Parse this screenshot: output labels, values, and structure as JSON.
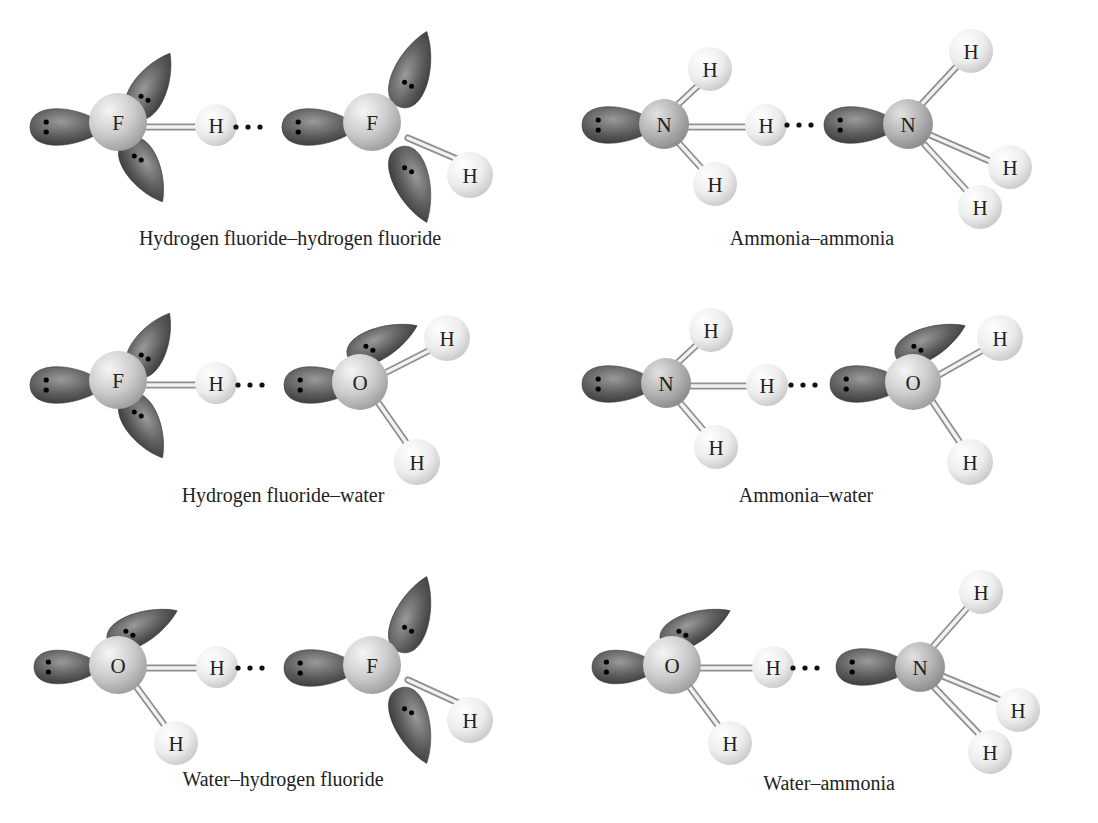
{
  "figure": {
    "colors": {
      "lobe_dark": "#4a4a4a",
      "lobe_light": "#9a9a9a",
      "heavy_atom_light": "#e6e6e6",
      "heavy_atom_dark": "#9c9c9c",
      "hydrogen_light": "#f7f7f7",
      "hydrogen_dark": "#c8c8c8",
      "bond_light": "#f4f4f4",
      "bond_dark": "#9a9a9a",
      "text": "#222222"
    },
    "panels": [
      {
        "id": "hf-hf",
        "caption": "Hydrogen fluoride–hydrogen fluoride",
        "caption_pos": [
          290,
          245
        ],
        "dots": [
          248,
          127
        ],
        "lobes": [
          {
            "x": 66,
            "y": 127,
            "rx": 36,
            "ry": 25,
            "rot": 0,
            "tipx": 105,
            "dots": "v"
          },
          {
            "x": 150,
            "y": 88,
            "rx": 34,
            "ry": 24,
            "rot": -60,
            "dots": "d"
          },
          {
            "x": 143,
            "y": 168,
            "rx": 33,
            "ry": 24,
            "rot": 60,
            "dots": "d"
          },
          {
            "x": 318,
            "y": 127,
            "rx": 36,
            "ry": 25,
            "rot": 0,
            "dots": "v"
          },
          {
            "x": 412,
            "y": 72,
            "rx": 37,
            "ry": 25,
            "rot": -70,
            "dots": "d"
          },
          {
            "x": 412,
            "y": 182,
            "rx": 37,
            "ry": 25,
            "rot": 70,
            "dots": "d"
          }
        ],
        "bonds": [
          {
            "x1": 140,
            "y1": 127,
            "x2": 205,
            "y2": 127
          },
          {
            "x1": 408,
            "y1": 138,
            "x2": 478,
            "y2": 168
          }
        ],
        "atoms": [
          {
            "el": "F",
            "x": 118,
            "y": 122,
            "r": 29,
            "kind": "heavy"
          },
          {
            "el": "H",
            "x": 216,
            "y": 125,
            "r": 21,
            "kind": "h"
          },
          {
            "el": "F",
            "x": 372,
            "y": 122,
            "r": 29,
            "kind": "heavy"
          },
          {
            "el": "H",
            "x": 470,
            "y": 175,
            "r": 23,
            "kind": "h"
          }
        ]
      },
      {
        "id": "nh3-nh3",
        "caption": "Ammonia–ammonia",
        "caption_pos": [
          812,
          245
        ],
        "dots": [
          799,
          125
        ],
        "lobes": [
          {
            "x": 618,
            "y": 125,
            "rx": 36,
            "ry": 25,
            "rot": 0,
            "dots": "v"
          },
          {
            "x": 860,
            "y": 125,
            "rx": 36,
            "ry": 25,
            "rot": 0,
            "dots": "v"
          }
        ],
        "bonds": [
          {
            "x1": 680,
            "y1": 127,
            "x2": 750,
            "y2": 127
          },
          {
            "x1": 672,
            "y1": 110,
            "x2": 702,
            "y2": 82
          },
          {
            "x1": 676,
            "y1": 140,
            "x2": 705,
            "y2": 172
          },
          {
            "x1": 918,
            "y1": 108,
            "x2": 958,
            "y2": 65
          },
          {
            "x1": 930,
            "y1": 135,
            "x2": 992,
            "y2": 162
          },
          {
            "x1": 925,
            "y1": 145,
            "x2": 968,
            "y2": 192
          }
        ],
        "atoms": [
          {
            "el": "N",
            "x": 664,
            "y": 124,
            "r": 25,
            "kind": "heavy2"
          },
          {
            "el": "H",
            "x": 710,
            "y": 69,
            "r": 22,
            "kind": "h"
          },
          {
            "el": "H",
            "x": 715,
            "y": 184,
            "r": 22,
            "kind": "h"
          },
          {
            "el": "H",
            "x": 766,
            "y": 125,
            "r": 21,
            "kind": "h"
          },
          {
            "el": "N",
            "x": 908,
            "y": 124,
            "r": 25,
            "kind": "heavy2"
          },
          {
            "el": "H",
            "x": 971,
            "y": 51,
            "r": 22,
            "kind": "h"
          },
          {
            "el": "H",
            "x": 1010,
            "y": 167,
            "r": 22,
            "kind": "h"
          },
          {
            "el": "H",
            "x": 980,
            "y": 207,
            "r": 22,
            "kind": "h"
          }
        ]
      },
      {
        "id": "hf-h2o",
        "caption": "Hydrogen fluoride–water",
        "caption_pos": [
          283,
          502
        ],
        "dots": [
          250,
          385
        ],
        "lobes": [
          {
            "x": 66,
            "y": 385,
            "rx": 36,
            "ry": 25,
            "rot": 0,
            "dots": "v"
          },
          {
            "x": 150,
            "y": 347,
            "rx": 33,
            "ry": 24,
            "rot": -60,
            "dots": "d"
          },
          {
            "x": 143,
            "y": 424,
            "rx": 33,
            "ry": 24,
            "rot": 60,
            "dots": "d"
          },
          {
            "x": 320,
            "y": 385,
            "rx": 36,
            "ry": 25,
            "rot": 0,
            "dots": "v"
          },
          {
            "x": 380,
            "y": 343,
            "rx": 35,
            "ry": 22,
            "rot": -25,
            "dots": "d"
          }
        ],
        "bonds": [
          {
            "x1": 140,
            "y1": 385,
            "x2": 205,
            "y2": 385
          },
          {
            "x1": 375,
            "y1": 378,
            "x2": 440,
            "y2": 345
          },
          {
            "x1": 375,
            "y1": 398,
            "x2": 410,
            "y2": 448
          }
        ],
        "atoms": [
          {
            "el": "F",
            "x": 118,
            "y": 380,
            "r": 29,
            "kind": "heavy"
          },
          {
            "el": "H",
            "x": 216,
            "y": 383,
            "r": 21,
            "kind": "h"
          },
          {
            "el": "O",
            "x": 360,
            "y": 382,
            "r": 28,
            "kind": "heavy"
          },
          {
            "el": "H",
            "x": 447,
            "y": 338,
            "r": 23,
            "kind": "h"
          },
          {
            "el": "H",
            "x": 417,
            "y": 462,
            "r": 23,
            "kind": "h"
          }
        ]
      },
      {
        "id": "nh3-h2o",
        "caption": "Ammonia–water",
        "caption_pos": [
          806,
          502
        ],
        "dots": [
          803,
          385
        ],
        "lobes": [
          {
            "x": 618,
            "y": 384,
            "rx": 36,
            "ry": 25,
            "rot": 0,
            "dots": "v"
          },
          {
            "x": 866,
            "y": 384,
            "rx": 36,
            "ry": 25,
            "rot": 0,
            "dots": "v"
          },
          {
            "x": 928,
            "y": 343,
            "rx": 35,
            "ry": 22,
            "rot": -25,
            "dots": "d"
          }
        ],
        "bonds": [
          {
            "x1": 680,
            "y1": 386,
            "x2": 750,
            "y2": 386
          },
          {
            "x1": 672,
            "y1": 368,
            "x2": 702,
            "y2": 340
          },
          {
            "x1": 676,
            "y1": 398,
            "x2": 705,
            "y2": 432
          },
          {
            "x1": 930,
            "y1": 380,
            "x2": 990,
            "y2": 346
          },
          {
            "x1": 930,
            "y1": 398,
            "x2": 965,
            "y2": 450
          }
        ],
        "atoms": [
          {
            "el": "N",
            "x": 666,
            "y": 383,
            "r": 25,
            "kind": "heavy2"
          },
          {
            "el": "H",
            "x": 711,
            "y": 330,
            "r": 22,
            "kind": "h"
          },
          {
            "el": "H",
            "x": 716,
            "y": 447,
            "r": 22,
            "kind": "h"
          },
          {
            "el": "H",
            "x": 767,
            "y": 385,
            "r": 21,
            "kind": "h"
          },
          {
            "el": "O",
            "x": 913,
            "y": 382,
            "r": 28,
            "kind": "heavy"
          },
          {
            "el": "H",
            "x": 1000,
            "y": 338,
            "r": 23,
            "kind": "h"
          },
          {
            "el": "H",
            "x": 970,
            "y": 462,
            "r": 23,
            "kind": "h"
          }
        ]
      },
      {
        "id": "h2o-hf",
        "caption": "Water–hydrogen fluoride",
        "caption_pos": [
          283,
          786
        ],
        "dots": [
          250,
          668
        ],
        "lobes": [
          {
            "x": 66,
            "y": 667,
            "rx": 32,
            "ry": 23,
            "rot": 0,
            "dots": "v"
          },
          {
            "x": 140,
            "y": 628,
            "rx": 35,
            "ry": 22,
            "rot": -25,
            "dots": "d"
          },
          {
            "x": 320,
            "y": 668,
            "rx": 36,
            "ry": 25,
            "rot": 0,
            "dots": "v"
          },
          {
            "x": 412,
            "y": 617,
            "rx": 37,
            "ry": 25,
            "rot": -70,
            "dots": "d"
          },
          {
            "x": 412,
            "y": 723,
            "rx": 37,
            "ry": 25,
            "rot": 70,
            "dots": "d"
          }
        ],
        "bonds": [
          {
            "x1": 140,
            "y1": 668,
            "x2": 205,
            "y2": 668
          },
          {
            "x1": 135,
            "y1": 685,
            "x2": 168,
            "y2": 730
          },
          {
            "x1": 408,
            "y1": 680,
            "x2": 478,
            "y2": 712
          }
        ],
        "atoms": [
          {
            "el": "O",
            "x": 118,
            "y": 665,
            "r": 29,
            "kind": "heavy"
          },
          {
            "el": "H",
            "x": 217,
            "y": 667,
            "r": 21,
            "kind": "h"
          },
          {
            "el": "H",
            "x": 176,
            "y": 743,
            "r": 22,
            "kind": "h"
          },
          {
            "el": "F",
            "x": 372,
            "y": 665,
            "r": 29,
            "kind": "heavy"
          },
          {
            "el": "H",
            "x": 470,
            "y": 720,
            "r": 23,
            "kind": "h"
          }
        ]
      },
      {
        "id": "h2o-nh3",
        "caption": "Water–ammonia",
        "caption_pos": [
          829,
          790
        ],
        "dots": [
          805,
          668
        ],
        "lobes": [
          {
            "x": 624,
            "y": 667,
            "rx": 32,
            "ry": 23,
            "rot": 0,
            "dots": "v"
          },
          {
            "x": 693,
            "y": 628,
            "rx": 35,
            "ry": 22,
            "rot": -25,
            "dots": "d"
          },
          {
            "x": 872,
            "y": 667,
            "rx": 36,
            "ry": 25,
            "rot": 0,
            "dots": "v"
          }
        ],
        "bonds": [
          {
            "x1": 692,
            "y1": 668,
            "x2": 758,
            "y2": 668
          },
          {
            "x1": 688,
            "y1": 685,
            "x2": 720,
            "y2": 728
          },
          {
            "x1": 930,
            "y1": 650,
            "x2": 967,
            "y2": 608
          },
          {
            "x1": 940,
            "y1": 675,
            "x2": 1000,
            "y2": 700
          },
          {
            "x1": 935,
            "y1": 688,
            "x2": 978,
            "y2": 733
          }
        ],
        "atoms": [
          {
            "el": "O",
            "x": 672,
            "y": 665,
            "r": 29,
            "kind": "heavy"
          },
          {
            "el": "H",
            "x": 773,
            "y": 667,
            "r": 21,
            "kind": "h"
          },
          {
            "el": "H",
            "x": 730,
            "y": 743,
            "r": 22,
            "kind": "h"
          },
          {
            "el": "N",
            "x": 920,
            "y": 667,
            "r": 25,
            "kind": "heavy2"
          },
          {
            "el": "H",
            "x": 981,
            "y": 592,
            "r": 22,
            "kind": "h"
          },
          {
            "el": "H",
            "x": 1018,
            "y": 710,
            "r": 22,
            "kind": "h"
          },
          {
            "el": "H",
            "x": 990,
            "y": 752,
            "r": 22,
            "kind": "h"
          }
        ]
      }
    ]
  }
}
